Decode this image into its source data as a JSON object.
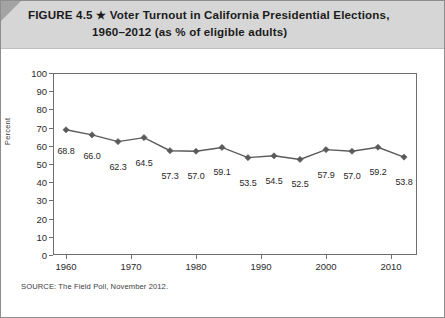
{
  "figure": {
    "number_label": "FIGURE 4.5",
    "star_glyph": "★",
    "title_line1": "Voter Turnout in California Presidential Elections,",
    "title_line2": "1960–2012 (as % of eligible adults)",
    "source": "SOURCE: The Field Poll, November 2012."
  },
  "chart_data": {
    "type": "line",
    "title": "Voter Turnout in California Presidential Elections, 1960–2012 (as % of eligible adults)",
    "xlabel": "",
    "ylabel": "Percent",
    "x": [
      1960,
      1964,
      1968,
      1972,
      1976,
      1980,
      1984,
      1988,
      1992,
      1996,
      2000,
      2004,
      2008,
      2012
    ],
    "values": [
      68.8,
      66.0,
      62.3,
      64.5,
      57.3,
      57.0,
      59.1,
      53.5,
      54.5,
      52.5,
      57.9,
      57.0,
      59.2,
      53.8
    ],
    "point_labels": [
      "68.8",
      "66.0",
      "62.3",
      "64.5",
      "57.3",
      "57.0",
      "59.1",
      "53.5",
      "54.5",
      "52.5",
      "57.9",
      "57.0",
      "59.2",
      "53.8"
    ],
    "xlim": [
      1958,
      2014
    ],
    "ylim": [
      0,
      100
    ],
    "ytick_values": [
      0,
      10,
      20,
      30,
      40,
      50,
      60,
      70,
      80,
      90,
      100
    ],
    "ytick_labels": [
      "0",
      "10",
      "20",
      "30",
      "40",
      "50",
      "60",
      "70",
      "80",
      "90",
      "100"
    ],
    "xtick_values": [
      1960,
      1970,
      1980,
      1990,
      2000,
      2010
    ],
    "xtick_labels": [
      "1960",
      "1970",
      "1980",
      "1990",
      "2000",
      "2010"
    ],
    "grid": false,
    "legend": null,
    "marker": "diamond",
    "series_color": "#5a5a5a"
  },
  "colors": {
    "header_band": "#d6d6d6",
    "frame": "#8d8d8d",
    "axis": "#6e6e6e",
    "line": "#5a5a5a",
    "text": "#1b1b1b"
  }
}
